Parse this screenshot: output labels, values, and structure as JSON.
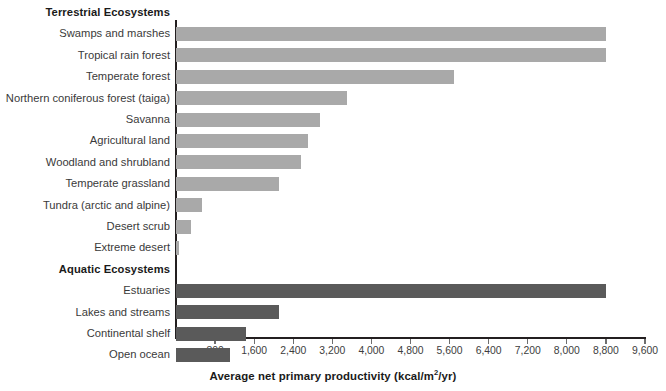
{
  "chart_data": {
    "type": "bar",
    "orientation": "horizontal",
    "title": "",
    "xlabel_text": "Average net primary productivity (kcal/m",
    "xlabel_sup": "2",
    "xlabel_tail": "/yr)",
    "xlabel": "Average net primary productivity (kcal/m2/yr)",
    "ylabel": "",
    "xlim": [
      0,
      9600
    ],
    "xtick_step": 800,
    "xticks": [
      800,
      1600,
      2400,
      3200,
      4000,
      4800,
      5600,
      6400,
      7200,
      8000,
      8800,
      9600
    ],
    "xticklabels": [
      "800",
      "1,600",
      "2,400",
      "3,200",
      "4,000",
      "4,800",
      "5,600",
      "6,400",
      "7,200",
      "8,000",
      "8,800",
      "9,600"
    ],
    "grid": false,
    "legend": "none",
    "groups": [
      {
        "name": "Terrestrial Ecosystems",
        "color": "#a9a9a9",
        "categories": [
          "Swamps and marshes",
          "Tropical rain forest",
          "Temperate forest",
          "Northern coniferous forest (taiga)",
          "Savanna",
          "Agricultural land",
          "Woodland and shrubland",
          "Temperate grassland",
          "Tundra (arctic and alpine)",
          "Desert scrub",
          "Extreme desert"
        ],
        "values": [
          8800,
          8800,
          5700,
          3500,
          2950,
          2700,
          2560,
          2100,
          530,
          310,
          60
        ]
      },
      {
        "name": "Aquatic Ecosystems",
        "color": "#5a5a5a",
        "categories": [
          "Estuaries",
          "Lakes and streams",
          "Continental shelf",
          "Open ocean"
        ],
        "values": [
          8800,
          2100,
          1430,
          1100
        ]
      }
    ]
  },
  "colors": {
    "terrestrial_bar": "#a9a9a9",
    "aquatic_bar": "#5a5a5a",
    "axis": "#231f20",
    "label_text": "#3a3a3a",
    "background": "#ffffff"
  }
}
